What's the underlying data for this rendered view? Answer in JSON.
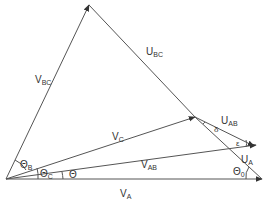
{
  "diagram": {
    "type": "phasor-vector-diagram",
    "colors": {
      "line": "#555555",
      "text": "#333333",
      "background": "#ffffff"
    },
    "vectors": [
      {
        "id": "VA",
        "label": "V",
        "sub": "A",
        "from": [
          6,
          179
        ],
        "to": [
          262,
          179
        ]
      },
      {
        "id": "VAB",
        "label": "V",
        "sub": "AB",
        "from": [
          6,
          179
        ],
        "to": [
          256,
          145
        ]
      },
      {
        "id": "VC",
        "label": "V",
        "sub": "C",
        "from": [
          6,
          179
        ],
        "to": [
          195,
          117
        ]
      },
      {
        "id": "VBC",
        "label": "V",
        "sub": "BC",
        "from": [
          6,
          179
        ],
        "to": [
          89,
          5
        ]
      },
      {
        "id": "UBC",
        "label": "U",
        "sub": "BC",
        "from": [
          89,
          5
        ],
        "to": [
          195,
          117
        ]
      },
      {
        "id": "UAB",
        "label": "U",
        "sub": "AB",
        "from": [
          195,
          117
        ],
        "to": [
          254,
          146
        ]
      },
      {
        "id": "UA",
        "label": "U",
        "sub": "A",
        "from": [
          195,
          117
        ],
        "to": [
          262,
          179
        ]
      }
    ],
    "labels": {
      "vbc": {
        "main": "V",
        "sub": "BC"
      },
      "ubc": {
        "main": "U",
        "sub": "BC"
      },
      "vc": {
        "main": "V",
        "sub": "C"
      },
      "uab": {
        "main": "U",
        "sub": "AB"
      },
      "vab": {
        "main": "V",
        "sub": "AB"
      },
      "ua": {
        "main": "U",
        "sub": "A"
      },
      "va": {
        "main": "V",
        "sub": "A"
      },
      "thetaB": {
        "main": "Θ",
        "sub": "B"
      },
      "thetaC": {
        "main": "Θ",
        "sub": "C"
      },
      "theta": {
        "main": "Θ",
        "sub": ""
      },
      "theta0": {
        "main": "Θ",
        "sub": "0"
      },
      "delta": {
        "main": "δ",
        "sub": ""
      },
      "epsilon": {
        "main": "ε",
        "sub": ""
      }
    }
  }
}
